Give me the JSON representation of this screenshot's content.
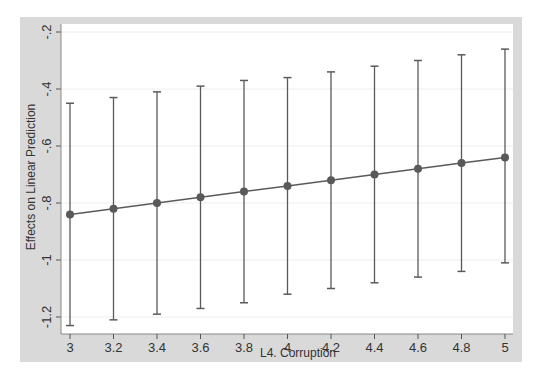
{
  "chart_data": {
    "type": "line",
    "title": "",
    "xlabel": "L4. Corruption",
    "ylabel": "Effects on Linear Prediction",
    "x": [
      3,
      3.2,
      3.4,
      3.6,
      3.8,
      4,
      4.2,
      4.4,
      4.6,
      4.8,
      5
    ],
    "series": [
      {
        "name": "Effect",
        "values": [
          -0.84,
          -0.82,
          -0.8,
          -0.78,
          -0.76,
          -0.74,
          -0.72,
          -0.7,
          -0.68,
          -0.66,
          -0.64
        ],
        "ci_upper": [
          -0.45,
          -0.43,
          -0.41,
          -0.39,
          -0.37,
          -0.36,
          -0.34,
          -0.32,
          -0.3,
          -0.28,
          -0.26
        ],
        "ci_lower": [
          -1.23,
          -1.21,
          -1.19,
          -1.17,
          -1.15,
          -1.12,
          -1.1,
          -1.08,
          -1.06,
          -1.04,
          -1.01
        ]
      }
    ],
    "xticks": [
      "3",
      "3.2",
      "3.4",
      "3.6",
      "3.8",
      "4",
      "4.2",
      "4.4",
      "4.6",
      "4.8",
      "5"
    ],
    "yticks": [
      "-.2",
      "-.4",
      "-.6",
      "-.8",
      "-1",
      "-1.2"
    ],
    "xlim": [
      3,
      5
    ],
    "ylim": [
      -1.25,
      -0.18
    ],
    "grid": true,
    "legend": "none",
    "colors": {
      "outer_bg": "#d9d9d9",
      "plot_bg": "#ffffff",
      "line": "#5a5a5a",
      "marker": "#595959",
      "grid": "#eeeeee"
    }
  }
}
